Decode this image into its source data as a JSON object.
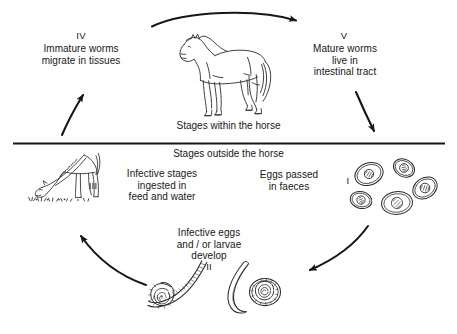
{
  "diagram": {
    "ink_color": "#171717",
    "background": "#ffffff",
    "bands": {
      "inside_label": "Stages within the horse",
      "outside_label": "Stages outside the horse"
    },
    "stages": [
      {
        "numeral": "I",
        "text": "Eggs passed\nin faeces",
        "numeral_side": "right",
        "illustration": "parasite-eggs-cluster"
      },
      {
        "numeral": "II",
        "text": "Infective eggs\nand / or larvae\ndevelop",
        "numeral_side": "below",
        "illustration": "coiled-larvae"
      },
      {
        "numeral": "III",
        "text": "Infective stages\ningested in\nfeed and water",
        "numeral_side": "left",
        "illustration": "grazing-horse"
      },
      {
        "numeral": "IV",
        "text": "Immature worms\nmigrate in tissues",
        "numeral_side": "above",
        "illustration": "none"
      },
      {
        "numeral": "V",
        "text": "Mature worms\nlive in\nintestinal tract",
        "numeral_side": "above",
        "illustration": "none"
      }
    ],
    "central_illustration": "standing-horse",
    "arrows": [
      {
        "name": "arrow-top-arc",
        "from": "stage-iv",
        "to": "stage-v",
        "direction": "left-to-right"
      },
      {
        "name": "arrow-right-descend",
        "from": "stage-v",
        "to": "stage-i",
        "direction": "down"
      },
      {
        "name": "arrow-bottom-right",
        "from": "stage-i",
        "to": "stage-ii",
        "direction": "down-left"
      },
      {
        "name": "arrow-bottom-left",
        "from": "stage-ii",
        "to": "stage-iii",
        "direction": "up-left"
      },
      {
        "name": "arrow-left-ascend",
        "from": "stage-iii",
        "to": "stage-iv",
        "direction": "up-right"
      }
    ]
  }
}
